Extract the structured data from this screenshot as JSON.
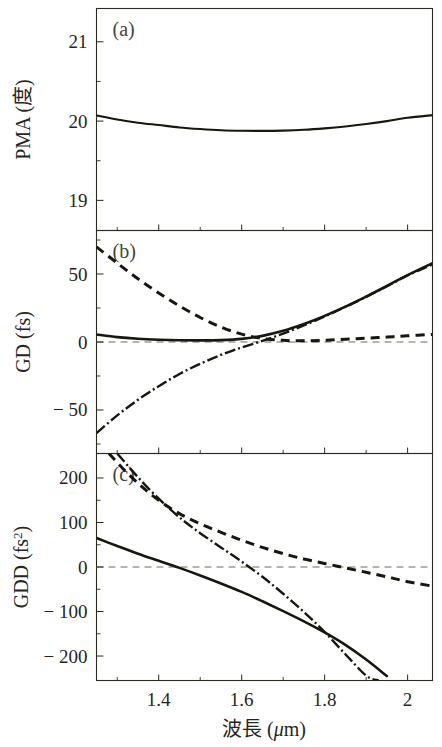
{
  "figure": {
    "xlabel": "波長 (μ m)",
    "xlabel_main": "波長 (",
    "xlabel_mu": "μ",
    "xlabel_tail": "m)"
  },
  "chart_data": [
    {
      "type": "line",
      "panel": "a",
      "panel_label": "(a)",
      "title": "",
      "xlabel": "波長 (μm)",
      "ylabel": "PMA (度)",
      "ylabel_text": "PMA (度)",
      "xlim": [
        1.25,
        2.06
      ],
      "ylim": [
        18.62,
        21.42
      ],
      "xticks": [
        1.4,
        1.6,
        1.8,
        2
      ],
      "xticklabels": [
        "1.4",
        "1.6",
        "1.8",
        "2"
      ],
      "xticks_minor": [
        1.3,
        1.5,
        1.7,
        1.9
      ],
      "yticks": [
        19,
        20,
        21
      ],
      "yticklabels": [
        "19",
        "20",
        "21"
      ],
      "yticks_minor": [
        19.5,
        20.5
      ],
      "grid": false,
      "legend": "none",
      "series": [
        {
          "name": "PMA",
          "style": "solid",
          "x": [
            1.25,
            1.3,
            1.35,
            1.4,
            1.45,
            1.5,
            1.55,
            1.6,
            1.65,
            1.7,
            1.75,
            1.8,
            1.85,
            1.9,
            1.95,
            2.0,
            2.06
          ],
          "values": [
            20.07,
            20.02,
            19.98,
            19.95,
            19.92,
            19.9,
            19.885,
            19.878,
            19.876,
            19.88,
            19.89,
            19.908,
            19.932,
            19.963,
            20.0,
            20.043,
            20.075
          ]
        }
      ]
    },
    {
      "type": "line",
      "panel": "b",
      "panel_label": "(b)",
      "title": "",
      "xlabel": "波長 (μm)",
      "ylabel": "GD (fs)",
      "ylabel_text": "GD (fs)",
      "xlim": [
        1.25,
        2.06
      ],
      "ylim": [
        -82,
        82
      ],
      "xticks": [
        1.4,
        1.6,
        1.8,
        2
      ],
      "xticklabels": [
        "1.4",
        "1.6",
        "1.8",
        "2"
      ],
      "xticks_minor": [
        1.3,
        1.5,
        1.7,
        1.9
      ],
      "yticks": [
        -50,
        0,
        50
      ],
      "yticklabels": [
        "− 50",
        "0",
        "50"
      ],
      "yticks_minor": [
        -75,
        -25,
        25,
        75
      ],
      "grid": false,
      "legend": "none",
      "zero_line": 0,
      "series": [
        {
          "name": "GD solid",
          "style": "solid",
          "x": [
            1.25,
            1.3,
            1.35,
            1.4,
            1.45,
            1.5,
            1.55,
            1.6,
            1.65,
            1.7,
            1.75,
            1.8,
            1.85,
            1.9,
            1.95,
            2.0,
            2.06
          ],
          "values": [
            5.5,
            3.6,
            2.4,
            1.7,
            1.3,
            1.2,
            1.4,
            2.3,
            4.5,
            8.2,
            13.2,
            19.2,
            26.0,
            33.4,
            41.2,
            49.2,
            58.0
          ]
        },
        {
          "name": "GD dashed",
          "style": "dashed",
          "x": [
            1.25,
            1.3,
            1.35,
            1.4,
            1.45,
            1.5,
            1.55,
            1.6,
            1.65,
            1.7,
            1.75,
            1.8,
            1.85,
            1.9,
            1.95,
            2.0,
            2.06
          ],
          "values": [
            70.0,
            58.0,
            46.5,
            36.0,
            26.5,
            18.0,
            11.0,
            5.8,
            2.6,
            1.2,
            0.9,
            1.3,
            2.0,
            2.8,
            3.6,
            4.6,
            5.6
          ]
        },
        {
          "name": "GD dash-dot",
          "style": "dashdot",
          "x": [
            1.25,
            1.3,
            1.35,
            1.4,
            1.45,
            1.5,
            1.55,
            1.6,
            1.65,
            1.7,
            1.75,
            1.8,
            1.85,
            1.9,
            1.95,
            2.0,
            2.06
          ],
          "values": [
            -67.0,
            -54.0,
            -42.5,
            -32.5,
            -23.5,
            -16.0,
            -9.5,
            -4.0,
            0.8,
            6.2,
            12.2,
            18.8,
            25.8,
            33.2,
            41.0,
            49.0,
            57.0
          ]
        }
      ]
    },
    {
      "type": "line",
      "panel": "c",
      "panel_label": "(c)",
      "title": "",
      "xlabel": "波長 (μm)",
      "ylabel": "GDD (fs²)",
      "ylabel_text": "GDD (fs",
      "ylabel_sup": "2",
      "ylabel_close": ")",
      "xlim": [
        1.25,
        2.06
      ],
      "ylim": [
        -255,
        255
      ],
      "xticks": [
        1.4,
        1.6,
        1.8,
        2
      ],
      "xticklabels": [
        "1.4",
        "1.6",
        "1.8",
        "2"
      ],
      "xticks_minor": [
        1.3,
        1.5,
        1.7,
        1.9
      ],
      "yticks": [
        -200,
        -100,
        0,
        100,
        200
      ],
      "yticklabels": [
        "− 200",
        "− 100",
        "0",
        "100",
        "200"
      ],
      "yticks_minor": [
        -150,
        -50,
        50,
        150
      ],
      "grid": false,
      "legend": "none",
      "zero_line": 0,
      "series": [
        {
          "name": "GDD solid",
          "style": "solid",
          "x": [
            1.25,
            1.3,
            1.35,
            1.4,
            1.45,
            1.5,
            1.55,
            1.6,
            1.65,
            1.7,
            1.75,
            1.8,
            1.85,
            1.9,
            1.95
          ],
          "values": [
            65,
            47,
            30,
            14,
            -2,
            -19,
            -37,
            -56,
            -77,
            -99,
            -122,
            -147,
            -175,
            -208,
            -245
          ]
        },
        {
          "name": "GDD dashed",
          "style": "dashed",
          "x": [
            1.28,
            1.32,
            1.36,
            1.4,
            1.45,
            1.5,
            1.55,
            1.6,
            1.65,
            1.7,
            1.75,
            1.8,
            1.85,
            1.9,
            1.95,
            2.0,
            2.06
          ],
          "values": [
            255,
            215,
            180,
            150,
            120,
            97,
            78,
            60,
            44,
            30,
            18,
            8,
            -2,
            -12,
            -22,
            -33,
            -43
          ]
        },
        {
          "name": "GDD dash-dot",
          "style": "dashdot",
          "x": [
            1.3,
            1.34,
            1.38,
            1.42,
            1.46,
            1.5,
            1.55,
            1.6,
            1.65,
            1.7,
            1.75,
            1.8,
            1.85,
            1.9,
            1.93
          ],
          "values": [
            255,
            212,
            172,
            136,
            104,
            76,
            44,
            12,
            -22,
            -60,
            -101,
            -146,
            -196,
            -244,
            -255
          ]
        }
      ]
    }
  ]
}
